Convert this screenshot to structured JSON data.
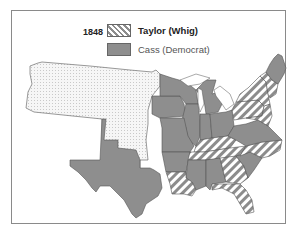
{
  "legend": {
    "year": "1848",
    "entries": [
      {
        "label": "Taylor (Whig)",
        "pattern": "diagonal-stripes",
        "color": "#8c8c8c"
      },
      {
        "label": "Cass (Democrat)",
        "pattern": "solid",
        "color": "#8e8e8e"
      }
    ]
  },
  "map": {
    "title": "1848 Presidential Election",
    "territory_pattern": "dotted",
    "colors": {
      "democrat": "#8e8e8e",
      "whig_stripe": "#8c8c8c",
      "territory": "#f4f4f4",
      "border": "#555555",
      "frame": "#8a8a8a"
    },
    "regions": [
      {
        "name": "Unorganized / Oregon Territory",
        "result": "territory"
      },
      {
        "name": "Texas",
        "result": "Cass (Democrat)"
      },
      {
        "name": "Iowa",
        "result": "Cass (Democrat)"
      },
      {
        "name": "Wisconsin",
        "result": "Cass (Democrat)"
      },
      {
        "name": "Michigan",
        "result": "Cass (Democrat)"
      },
      {
        "name": "Illinois",
        "result": "Cass (Democrat)"
      },
      {
        "name": "Indiana",
        "result": "Cass (Democrat)"
      },
      {
        "name": "Ohio",
        "result": "Cass (Democrat)"
      },
      {
        "name": "Missouri",
        "result": "Cass (Democrat)"
      },
      {
        "name": "Arkansas",
        "result": "Cass (Democrat)"
      },
      {
        "name": "Mississippi",
        "result": "Cass (Democrat)"
      },
      {
        "name": "Alabama",
        "result": "Cass (Democrat)"
      },
      {
        "name": "Virginia",
        "result": "Cass (Democrat)"
      },
      {
        "name": "South Carolina",
        "result": "Cass (Democrat)"
      },
      {
        "name": "Maine",
        "result": "Cass (Democrat)"
      },
      {
        "name": "New Hampshire",
        "result": "Cass (Democrat)"
      },
      {
        "name": "Kentucky",
        "result": "Taylor (Whig)"
      },
      {
        "name": "Tennessee",
        "result": "Taylor (Whig)"
      },
      {
        "name": "Louisiana",
        "result": "Taylor (Whig)"
      },
      {
        "name": "Georgia",
        "result": "Taylor (Whig)"
      },
      {
        "name": "Florida",
        "result": "Taylor (Whig)"
      },
      {
        "name": "North Carolina",
        "result": "Taylor (Whig)"
      },
      {
        "name": "New York",
        "result": "Taylor (Whig)"
      },
      {
        "name": "Pennsylvania",
        "result": "Taylor (Whig)"
      },
      {
        "name": "New England (VT, MA, RI, CT)",
        "result": "Taylor (Whig)"
      },
      {
        "name": "New Jersey / Delaware / Maryland",
        "result": "Taylor (Whig)"
      }
    ]
  }
}
